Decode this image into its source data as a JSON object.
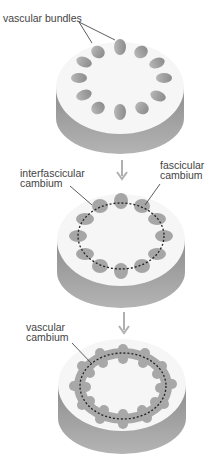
{
  "stages": [
    {
      "labels": [
        "vascular bundles"
      ]
    },
    {
      "labels": [
        "interfascicular cambium",
        "fascicular cambium"
      ]
    },
    {
      "labels": [
        "vascular cambium"
      ]
    }
  ],
  "labels": {
    "vascular_bundles": "vascular bundles",
    "interfascicular_line1": "interfascicular",
    "interfascicular_line2": "cambium",
    "fascicular_line1": "fascicular",
    "fascicular_line2": "cambium",
    "vascular_cambium_line1": "vascular",
    "vascular_cambium_line2": "cambium"
  },
  "colors": {
    "disc_top": "#f6f6f6",
    "disc_side": "#9a9a9a",
    "bundle": "#a8a8a8",
    "arrow": "#b0b0b0",
    "dashed": "#222222"
  }
}
